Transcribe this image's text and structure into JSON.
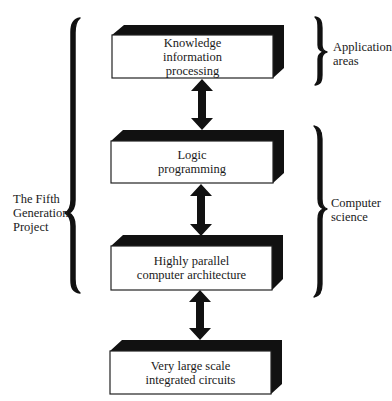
{
  "diagram": {
    "type": "layered-stack",
    "boxes": [
      {
        "id": "knowledge",
        "lines": [
          "Knowledge",
          "information",
          "processing"
        ]
      },
      {
        "id": "logic",
        "lines": [
          "Logic",
          "programming"
        ]
      },
      {
        "id": "architecture",
        "lines": [
          "Highly parallel",
          "computer architecture"
        ]
      },
      {
        "id": "vlsi",
        "lines": [
          "Very large scale",
          "integrated circuits"
        ]
      }
    ],
    "connectors": [
      {
        "from": "knowledge",
        "to": "logic",
        "style": "double-headed-arrow"
      },
      {
        "from": "logic",
        "to": "architecture",
        "style": "double-headed-arrow"
      },
      {
        "from": "architecture",
        "to": "vlsi",
        "style": "double-headed-arrow"
      }
    ],
    "braces": {
      "left": {
        "lines": [
          "The Fifth",
          "Generation",
          "Project"
        ],
        "spans": [
          "knowledge",
          "logic",
          "architecture"
        ]
      },
      "right_top": {
        "lines": [
          "Application",
          "areas"
        ],
        "spans": [
          "knowledge"
        ]
      },
      "right_middle": {
        "lines": [
          "Computer",
          "science"
        ],
        "spans": [
          "logic",
          "architecture"
        ]
      }
    },
    "colors": {
      "ink": "#111111",
      "box_face": "#ffffff",
      "background": "#ffffff"
    }
  }
}
